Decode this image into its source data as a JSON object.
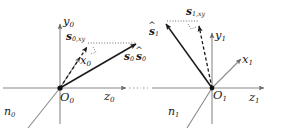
{
  "figure": {
    "type": "vector-geometry-diagram",
    "colors": {
      "axis": "#8a8a8a",
      "vector": "#1a1a1a",
      "dotted": "#6e6e6e",
      "label": "#1a1a1a",
      "background": "#ffffff"
    }
  },
  "left_frame": {
    "origin_label": "O",
    "origin_sub": "0",
    "axes": [
      {
        "name": "y-axis",
        "label": "y",
        "sub": "0"
      },
      {
        "name": "x-axis",
        "label": "x",
        "sub": "0"
      },
      {
        "name": "z-axis",
        "label": "z",
        "sub": "0"
      }
    ],
    "normal_line": {
      "label": "n",
      "sub": "0"
    },
    "vectors": [
      {
        "name": "sun-vector",
        "label": "s",
        "sub": "0",
        "hat": false,
        "style": "solid"
      },
      {
        "name": "sun-vector-projection",
        "label": "s",
        "sub": "0,xy",
        "hat": false,
        "style": "dashed"
      }
    ]
  },
  "right_frame": {
    "origin_label": "O",
    "origin_sub": "1",
    "axes": [
      {
        "name": "y-axis",
        "label": "y",
        "sub": "1"
      },
      {
        "name": "x-axis",
        "label": "x",
        "sub": "1"
      },
      {
        "name": "z-axis",
        "label": "z",
        "sub": "1"
      }
    ],
    "normal_line": {
      "label": "n",
      "sub": "1"
    },
    "vectors": [
      {
        "name": "sun-vector-hat",
        "label": "s",
        "sub": "1",
        "hat": true,
        "style": "solid"
      },
      {
        "name": "sun-vector-projection",
        "label": "s",
        "sub": "1,xy",
        "hat": false,
        "style": "dashed"
      }
    ]
  },
  "shared": {
    "carryover_vector": {
      "label": "s",
      "sub": "0",
      "hat": true
    }
  }
}
